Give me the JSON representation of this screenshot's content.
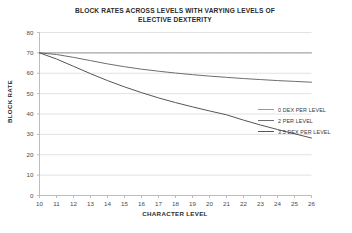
{
  "chart_data": {
    "type": "line",
    "title": "BLOCK RATES ACROSS LEVELS WITH VARYING LEVELS OF ELECTIVE DEXTERITY",
    "title_line1": "BLOCK RATES ACROSS LEVELS WITH VARYING LEVELS OF",
    "title_line2": "ELECTIVE DEXTERITY",
    "xlabel": "CHARACTER LEVEL",
    "ylabel": "BLOCK RATE",
    "x": [
      10,
      11,
      12,
      13,
      14,
      15,
      16,
      17,
      18,
      19,
      20,
      21,
      22,
      23,
      24,
      25,
      26
    ],
    "categories": [
      "10",
      "11",
      "12",
      "13",
      "14",
      "15",
      "16",
      "17",
      "18",
      "19",
      "20",
      "21",
      "22",
      "23",
      "24",
      "25",
      "26"
    ],
    "yticks": [
      "0",
      "10",
      "20",
      "30",
      "40",
      "50",
      "60",
      "70",
      "80"
    ],
    "ytick_values": [
      0,
      10,
      20,
      30,
      40,
      50,
      60,
      70,
      80
    ],
    "ylim": [
      0,
      80
    ],
    "xlim": [
      10,
      26
    ],
    "grid": "horizontal",
    "legend_position": "right",
    "series": [
      {
        "name": "0 DEX PER LEVEL",
        "color": "#9a9a9a",
        "values": [
          70,
          70,
          70,
          70,
          70,
          70,
          70,
          70,
          70,
          70,
          70,
          70,
          70,
          70,
          70,
          70,
          70
        ]
      },
      {
        "name": "2 PER LEVEL",
        "color": "#6e6e6e",
        "values": [
          70,
          69.2,
          67.8,
          66.2,
          64.6,
          63.2,
          62.0,
          61.0,
          60.1,
          59.3,
          58.6,
          58.0,
          57.4,
          56.9,
          56.4,
          56.0,
          55.6
        ]
      },
      {
        "name": "3.5 DEX PER LEVEL",
        "color": "#555555",
        "values": [
          70,
          67.0,
          63.4,
          59.8,
          56.4,
          53.3,
          50.5,
          47.9,
          45.6,
          43.5,
          41.5,
          39.6,
          37.0,
          34.6,
          32.4,
          30.3,
          28.2
        ]
      }
    ]
  }
}
